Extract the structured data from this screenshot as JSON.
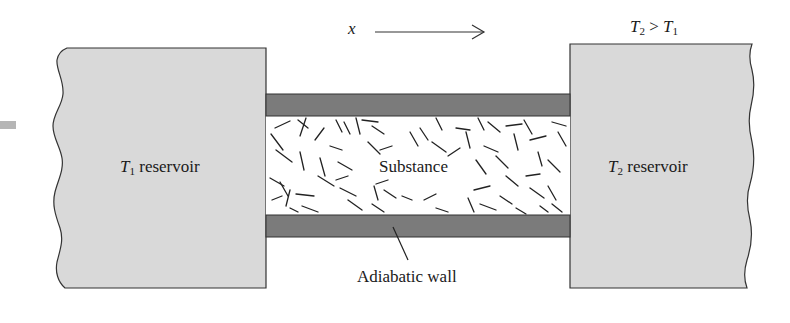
{
  "figure": {
    "axis_label": "x",
    "condition": {
      "left": "T",
      "left_sub": "2",
      "op": " > ",
      "right": "T",
      "right_sub": "1"
    },
    "left_reservoir": {
      "symbol": "T",
      "sub": "1",
      "text": " reservoir"
    },
    "right_reservoir": {
      "symbol": "T",
      "sub": "2",
      "text": " reservoir"
    },
    "substance_label": "Substance",
    "wall_label": "Adiabatic wall"
  },
  "colors": {
    "reservoir_fill": "#d9d9d9",
    "wall_fill": "#7b7b7b",
    "outline": "#333333",
    "fiber": "#222222",
    "side_tab": "#b5b5b5"
  }
}
